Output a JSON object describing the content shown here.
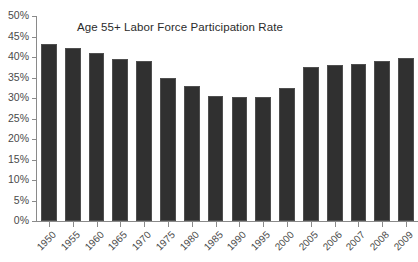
{
  "chart_data": {
    "type": "bar",
    "title": "Age 55+ Labor Force Participation Rate",
    "xlabel": "",
    "ylabel": "",
    "ylim": [
      0,
      50
    ],
    "ytick_step": 5,
    "ytick_suffix": "%",
    "grid": false,
    "legend": "none",
    "bar_color": "#303030",
    "axis_color": "#8a8a8a",
    "text_color": "#4a4a4a",
    "ytick_labels": [
      "0%",
      "5%",
      "10%",
      "15%",
      "20%",
      "25%",
      "30%",
      "35%",
      "40%",
      "45%",
      "50%"
    ],
    "ytick_values": [
      0,
      5,
      10,
      15,
      20,
      25,
      30,
      35,
      40,
      45,
      50
    ],
    "categories": [
      "1950",
      "1955",
      "1960",
      "1965",
      "1970",
      "1975",
      "1980",
      "1985",
      "1990",
      "1995",
      "2000",
      "2005",
      "2006",
      "2007",
      "2008",
      "2009"
    ],
    "values": [
      43.2,
      42.2,
      41.0,
      39.6,
      39.0,
      34.8,
      33.0,
      30.5,
      30.2,
      30.2,
      32.4,
      37.5,
      38.0,
      38.4,
      39.0,
      39.8
    ]
  }
}
